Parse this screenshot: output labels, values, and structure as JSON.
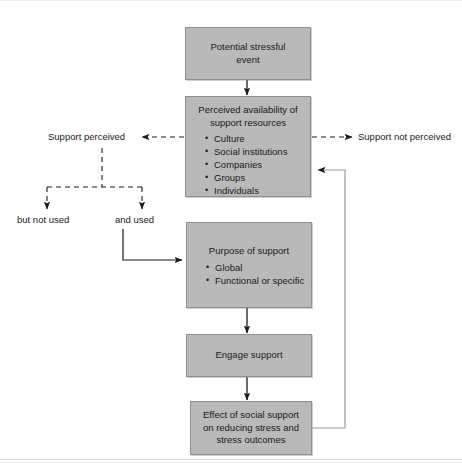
{
  "diagram": {
    "title_hidden": "",
    "colors": {
      "box_fill": "#b9b9b9",
      "box_border": "#8e8e8e",
      "line": "#1a1a1a",
      "feedback_line": "#8e8e8e",
      "background": "#ffffff"
    },
    "boxes": {
      "stressful_event": {
        "line1": "Potential stressful",
        "line2": "event"
      },
      "perceived_availability": {
        "line1": "Perceived availability of",
        "line2": "support resources",
        "bullets": [
          "Culture",
          "Social institutions",
          "Companies",
          "Groups",
          "Individuals"
        ]
      },
      "purpose_of_support": {
        "title": "Purpose of support",
        "bullets": [
          "Global",
          "Functional or specific"
        ]
      },
      "engage_support": {
        "title": "Engage support"
      },
      "effect": {
        "line1": "Effect of social support",
        "line2": "on reducing stress and",
        "line3": "stress outcomes"
      }
    },
    "labels": {
      "support_perceived": "Support perceived",
      "support_not_perceived": "Support not perceived",
      "but_not_used": "but not used",
      "and_used": "and used"
    }
  }
}
